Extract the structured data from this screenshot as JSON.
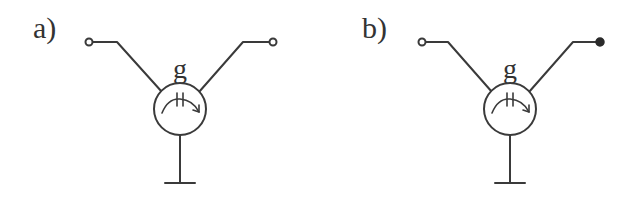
{
  "diagram": {
    "type": "circuit-symbols",
    "panels": [
      {
        "id": "a",
        "label": "a)",
        "element_label": "g",
        "left_terminal": "open",
        "right_terminal": "open",
        "offset_x": 0
      },
      {
        "id": "b",
        "label": "b)",
        "element_label": "g",
        "left_terminal": "open",
        "right_terminal": "filled",
        "offset_x": 331
      }
    ],
    "colors": {
      "line": "#3a3a3a",
      "text": "#333333",
      "background": "#ffffff"
    }
  }
}
